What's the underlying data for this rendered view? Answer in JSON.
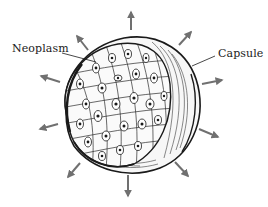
{
  "figure": {
    "labels": {
      "neoplasm": "Neoplasm",
      "capsule": "Capsule"
    },
    "colors": {
      "ink": "#1a1a1a",
      "arrow": "#707070",
      "background": "#ffffff",
      "capsule_fill": "#f4f4f4"
    },
    "arrows": {
      "count": 10,
      "meaning": "expansive (outward) growth direction"
    }
  }
}
